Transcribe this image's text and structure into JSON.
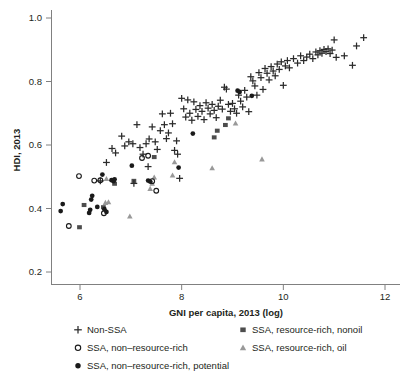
{
  "chart_data": {
    "type": "scatter",
    "title": "",
    "xlabel": "GNI per capita, 2013 (log)",
    "ylabel": "HDI, 2013",
    "xlim": [
      5.4,
      12.2
    ],
    "ylim": [
      0.18,
      1.04
    ],
    "xticks": [
      6,
      8,
      10,
      12
    ],
    "xticklabels": [
      "6",
      "8",
      "10",
      "12"
    ],
    "yticks": [
      0.2,
      0.4,
      0.6,
      0.8,
      1.0
    ],
    "yticklabels": [
      "0.2",
      "0.4",
      "0.6",
      "0.8",
      "1.0"
    ],
    "grid": false,
    "legend_position": "bottom",
    "series": [
      {
        "name": "Non-SSA",
        "marker": "plus",
        "color": "#2b2b2b",
        "points": [
          [
            6.52,
            0.545
          ],
          [
            6.63,
            0.589
          ],
          [
            6.7,
            0.575
          ],
          [
            6.82,
            0.628
          ],
          [
            6.88,
            0.597
          ],
          [
            6.96,
            0.61
          ],
          [
            7.04,
            0.604
          ],
          [
            7.12,
            0.664
          ],
          [
            7.18,
            0.592
          ],
          [
            7.24,
            0.571
          ],
          [
            7.3,
            0.604
          ],
          [
            7.36,
            0.619
          ],
          [
            7.42,
            0.657
          ],
          [
            7.48,
            0.61
          ],
          [
            7.52,
            0.586
          ],
          [
            7.58,
            0.645
          ],
          [
            7.62,
            0.698
          ],
          [
            7.66,
            0.664
          ],
          [
            7.7,
            0.62
          ],
          [
            7.74,
            0.638
          ],
          [
            7.78,
            0.7
          ],
          [
            7.82,
            0.667
          ],
          [
            7.86,
            0.583
          ],
          [
            7.9,
            0.613
          ],
          [
            7.92,
            0.571
          ],
          [
            7.96,
            0.495
          ],
          [
            8.0,
            0.747
          ],
          [
            8.04,
            0.714
          ],
          [
            8.08,
            0.688
          ],
          [
            8.12,
            0.742
          ],
          [
            8.16,
            0.7
          ],
          [
            8.2,
            0.678
          ],
          [
            8.24,
            0.736
          ],
          [
            8.28,
            0.712
          ],
          [
            8.32,
            0.69
          ],
          [
            8.36,
            0.724
          ],
          [
            8.4,
            0.706
          ],
          [
            8.44,
            0.68
          ],
          [
            8.48,
            0.733
          ],
          [
            8.52,
            0.716
          ],
          [
            8.56,
            0.698
          ],
          [
            8.6,
            0.728
          ],
          [
            8.64,
            0.709
          ],
          [
            8.68,
            0.686
          ],
          [
            8.72,
            0.722
          ],
          [
            8.76,
            0.741
          ],
          [
            8.8,
            0.713
          ],
          [
            8.84,
            0.782
          ],
          [
            8.88,
            0.776
          ],
          [
            8.92,
            0.728
          ],
          [
            8.96,
            0.706
          ],
          [
            9.0,
            0.731
          ],
          [
            9.04,
            0.714
          ],
          [
            9.08,
            0.7
          ],
          [
            9.12,
            0.757
          ],
          [
            9.16,
            0.738
          ],
          [
            9.2,
            0.72
          ],
          [
            9.24,
            0.772
          ],
          [
            9.28,
            0.751
          ],
          [
            9.32,
            0.705
          ],
          [
            9.36,
            0.815
          ],
          [
            9.4,
            0.802
          ],
          [
            9.44,
            0.786
          ],
          [
            9.48,
            0.757
          ],
          [
            9.52,
            0.828
          ],
          [
            9.56,
            0.812
          ],
          [
            9.6,
            0.775
          ],
          [
            9.64,
            0.841
          ],
          [
            9.68,
            0.826
          ],
          [
            9.72,
            0.805
          ],
          [
            9.76,
            0.847
          ],
          [
            9.8,
            0.833
          ],
          [
            9.84,
            0.818
          ],
          [
            9.88,
            0.855
          ],
          [
            9.92,
            0.838
          ],
          [
            9.96,
            0.862
          ],
          [
            10.0,
            0.788
          ],
          [
            10.04,
            0.849
          ],
          [
            10.08,
            0.866
          ],
          [
            10.12,
            0.843
          ],
          [
            10.2,
            0.872
          ],
          [
            10.28,
            0.858
          ],
          [
            10.34,
            0.881
          ],
          [
            10.4,
            0.866
          ],
          [
            10.46,
            0.877
          ],
          [
            10.52,
            0.886
          ],
          [
            10.58,
            0.872
          ],
          [
            10.64,
            0.893
          ],
          [
            10.68,
            0.884
          ],
          [
            10.72,
            0.897
          ],
          [
            10.76,
            0.889
          ],
          [
            10.8,
            0.901
          ],
          [
            10.84,
            0.894
          ],
          [
            10.88,
            0.903
          ],
          [
            10.92,
            0.888
          ],
          [
            10.96,
            0.899
          ],
          [
            11.0,
            0.931
          ],
          [
            11.04,
            0.876
          ],
          [
            11.2,
            0.881
          ],
          [
            11.36,
            0.851
          ],
          [
            11.44,
            0.912
          ],
          [
            11.58,
            0.938
          ],
          [
            7.06,
            0.479
          ],
          [
            7.34,
            0.532
          ],
          [
            6.4,
            0.487
          ]
        ]
      },
      {
        "name": "SSA, non–resource-rich",
        "marker": "circle-open",
        "color": "#1a1a1a",
        "points": [
          [
            5.78,
            0.345
          ],
          [
            5.98,
            0.502
          ],
          [
            6.28,
            0.488
          ],
          [
            6.4,
            0.489
          ],
          [
            6.47,
            0.385
          ],
          [
            7.22,
            0.559
          ],
          [
            7.34,
            0.566
          ],
          [
            7.42,
            0.486
          ],
          [
            7.5,
            0.456
          ]
        ]
      },
      {
        "name": "SSA, non–resource-rich, potential",
        "marker": "circle-filled",
        "color": "#1a1a1a",
        "points": [
          [
            5.62,
            0.392
          ],
          [
            5.66,
            0.414
          ],
          [
            6.24,
            0.44
          ],
          [
            6.22,
            0.428
          ],
          [
            6.2,
            0.396
          ],
          [
            6.18,
            0.386
          ],
          [
            6.34,
            0.405
          ],
          [
            6.44,
            0.507
          ],
          [
            6.48,
            0.398
          ],
          [
            6.52,
            0.389
          ],
          [
            6.62,
            0.489
          ],
          [
            6.66,
            0.486
          ],
          [
            6.68,
            0.492
          ],
          [
            7.02,
            0.535
          ],
          [
            7.34,
            0.488
          ],
          [
            7.38,
            0.485
          ],
          [
            7.94,
            0.529
          ],
          [
            8.22,
            0.636
          ],
          [
            9.1,
            0.771
          ],
          [
            9.14,
            0.767
          ],
          [
            9.38,
            0.755
          ]
        ]
      },
      {
        "name": "SSA, resource-rich, nonoil",
        "marker": "square-filled",
        "color": "#4d4d4d",
        "points": [
          [
            5.99,
            0.341
          ],
          [
            6.08,
            0.411
          ],
          [
            6.46,
            0.404
          ],
          [
            6.68,
            0.478
          ],
          [
            7.06,
            0.487
          ],
          [
            7.46,
            0.562
          ],
          [
            8.64,
            0.624
          ],
          [
            8.86,
            0.663
          ],
          [
            8.92,
            0.684
          ],
          [
            8.7,
            0.645
          ]
        ]
      },
      {
        "name": "SSA, resource-rich, oil",
        "marker": "triangle-filled",
        "color": "#999999",
        "points": [
          [
            6.52,
            0.493
          ],
          [
            6.56,
            0.42
          ],
          [
            6.98,
            0.375
          ],
          [
            7.38,
            0.462
          ],
          [
            7.42,
            0.478
          ],
          [
            7.46,
            0.498
          ],
          [
            7.82,
            0.504
          ],
          [
            7.86,
            0.546
          ],
          [
            8.6,
            0.527
          ],
          [
            9.06,
            0.668
          ],
          [
            9.58,
            0.555
          ],
          [
            6.5,
            0.418
          ]
        ]
      }
    ]
  },
  "legend": {
    "items": [
      {
        "label": "Non-SSA",
        "marker": "plus-icon"
      },
      {
        "label": "SSA, non–resource-rich",
        "marker": "circle-open-icon"
      },
      {
        "label": "SSA, non–resource-rich, potential",
        "marker": "circle-filled-icon"
      },
      {
        "label": "SSA, resource-rich, nonoil",
        "marker": "square-filled-icon"
      },
      {
        "label": "SSA, resource-rich, oil",
        "marker": "triangle-filled-icon"
      }
    ]
  },
  "colors": {
    "axis": "#808080",
    "text": "#231f20",
    "plus": "#2b2b2b",
    "circle": "#1a1a1a",
    "square": "#4d4d4d",
    "triangle": "#999999",
    "background": "#ffffff"
  }
}
